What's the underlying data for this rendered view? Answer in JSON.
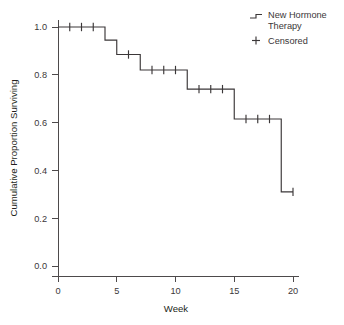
{
  "chart_data": {
    "type": "line",
    "subtype": "kaplan-meier-step",
    "title": "",
    "xlabel": "Week",
    "ylabel": "Cumulative Proportion Surviving",
    "xlim": [
      0,
      20
    ],
    "ylim": [
      0.0,
      1.0
    ],
    "xticks": [
      0,
      5,
      10,
      15,
      20
    ],
    "xtick_labels": [
      "0",
      "5",
      "10",
      "15",
      "20"
    ],
    "yticks": [
      0.0,
      0.2,
      0.4,
      0.6,
      0.8,
      1.0
    ],
    "ytick_labels": [
      "0.0",
      "0.2",
      "0.4",
      "0.6",
      "0.8",
      "1.0"
    ],
    "grid": false,
    "legend_position": "top-right",
    "series": [
      {
        "name": "New Hormone Therapy",
        "glyph": "step-line",
        "steps": [
          {
            "week_start": 0,
            "week_end": 4,
            "survival": 1.0
          },
          {
            "week_start": 4,
            "week_end": 5,
            "survival": 0.945
          },
          {
            "week_start": 5,
            "week_end": 7,
            "survival": 0.885
          },
          {
            "week_start": 7,
            "week_end": 11,
            "survival": 0.82
          },
          {
            "week_start": 11,
            "week_end": 15,
            "survival": 0.74
          },
          {
            "week_start": 15,
            "week_end": 19,
            "survival": 0.615
          },
          {
            "week_start": 19,
            "week_end": 20,
            "survival": 0.31
          }
        ],
        "event_times": [
          4,
          5,
          7,
          11,
          15,
          19
        ],
        "x": [
          0,
          4,
          4,
          5,
          5,
          7,
          7,
          11,
          11,
          15,
          15,
          19,
          19,
          20
        ],
        "y": [
          1.0,
          1.0,
          0.945,
          0.945,
          0.885,
          0.885,
          0.82,
          0.82,
          0.74,
          0.74,
          0.615,
          0.615,
          0.31,
          0.31
        ]
      },
      {
        "name": "Censored",
        "glyph": "plus",
        "points": [
          {
            "week": 1,
            "survival": 1.0
          },
          {
            "week": 2,
            "survival": 1.0
          },
          {
            "week": 3,
            "survival": 1.0
          },
          {
            "week": 6,
            "survival": 0.885
          },
          {
            "week": 8,
            "survival": 0.82
          },
          {
            "week": 9,
            "survival": 0.82
          },
          {
            "week": 10,
            "survival": 0.82
          },
          {
            "week": 12,
            "survival": 0.74
          },
          {
            "week": 13,
            "survival": 0.74
          },
          {
            "week": 14,
            "survival": 0.74
          },
          {
            "week": 16,
            "survival": 0.615
          },
          {
            "week": 17,
            "survival": 0.615
          },
          {
            "week": 18,
            "survival": 0.615
          },
          {
            "week": 20,
            "survival": 0.31
          }
        ]
      }
    ]
  },
  "legend": {
    "entries": [
      {
        "label_line1": "New Hormone",
        "label_line2": "Therapy",
        "glyph": "step-line"
      },
      {
        "label_line1": "Censored",
        "label_line2": "",
        "glyph": "plus"
      }
    ]
  },
  "colors": {
    "curve": "#3b3738",
    "axis": "#4d4a4b",
    "text": "#231f20",
    "background": "#ffffff"
  }
}
